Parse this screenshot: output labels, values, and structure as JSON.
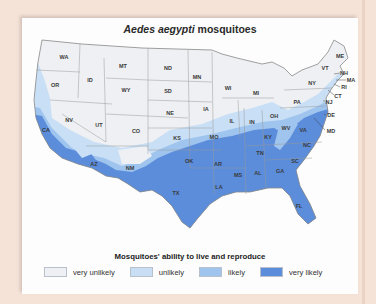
{
  "title": {
    "italic": "Aedes aegypti",
    "rest": " mosquitoes"
  },
  "legend": {
    "title": "Mosquitoes' ability to live and reproduce",
    "items": [
      {
        "label": "very unlikely",
        "color": "#eef0f3"
      },
      {
        "label": "unlikely",
        "color": "#c9dff6"
      },
      {
        "label": "likely",
        "color": "#9fc4ee"
      },
      {
        "label": "very likely",
        "color": "#5b8ddb"
      }
    ]
  },
  "states": [
    {
      "abbr": "WA",
      "x": 42,
      "y": 39
    },
    {
      "abbr": "OR",
      "x": 33,
      "y": 67
    },
    {
      "abbr": "CA",
      "x": 24,
      "y": 112
    },
    {
      "abbr": "ID",
      "x": 68,
      "y": 62
    },
    {
      "abbr": "NV",
      "x": 47,
      "y": 102
    },
    {
      "abbr": "MT",
      "x": 101,
      "y": 48
    },
    {
      "abbr": "WY",
      "x": 104,
      "y": 72
    },
    {
      "abbr": "UT",
      "x": 77,
      "y": 107
    },
    {
      "abbr": "CO",
      "x": 114,
      "y": 113
    },
    {
      "abbr": "AZ",
      "x": 72,
      "y": 146
    },
    {
      "abbr": "NM",
      "x": 108,
      "y": 150
    },
    {
      "abbr": "ND",
      "x": 146,
      "y": 50
    },
    {
      "abbr": "SD",
      "x": 146,
      "y": 73
    },
    {
      "abbr": "NE",
      "x": 148,
      "y": 95
    },
    {
      "abbr": "KS",
      "x": 155,
      "y": 120
    },
    {
      "abbr": "OK",
      "x": 167,
      "y": 143
    },
    {
      "abbr": "TX",
      "x": 154,
      "y": 175
    },
    {
      "abbr": "MN",
      "x": 175,
      "y": 59
    },
    {
      "abbr": "IA",
      "x": 184,
      "y": 91
    },
    {
      "abbr": "MO",
      "x": 192,
      "y": 119
    },
    {
      "abbr": "AR",
      "x": 196,
      "y": 146
    },
    {
      "abbr": "LA",
      "x": 197,
      "y": 169
    },
    {
      "abbr": "WI",
      "x": 206,
      "y": 70
    },
    {
      "abbr": "IL",
      "x": 210,
      "y": 103
    },
    {
      "abbr": "MS",
      "x": 216,
      "y": 157
    },
    {
      "abbr": "MI",
      "x": 234,
      "y": 75
    },
    {
      "abbr": "IN",
      "x": 230,
      "y": 104
    },
    {
      "abbr": "KY",
      "x": 246,
      "y": 119
    },
    {
      "abbr": "TN",
      "x": 238,
      "y": 135
    },
    {
      "abbr": "AL",
      "x": 236,
      "y": 155
    },
    {
      "abbr": "OH",
      "x": 252,
      "y": 98
    },
    {
      "abbr": "GA",
      "x": 258,
      "y": 153
    },
    {
      "abbr": "FL",
      "x": 277,
      "y": 188
    },
    {
      "abbr": "WV",
      "x": 264,
      "y": 110
    },
    {
      "abbr": "VA",
      "x": 281,
      "y": 112
    },
    {
      "abbr": "NC",
      "x": 285,
      "y": 127
    },
    {
      "abbr": "SC",
      "x": 273,
      "y": 143
    },
    {
      "abbr": "PA",
      "x": 275,
      "y": 84
    },
    {
      "abbr": "NY",
      "x": 290,
      "y": 65
    },
    {
      "abbr": "ME",
      "x": 318,
      "y": 38
    },
    {
      "abbr": "VT",
      "x": 303,
      "y": 50
    }
  ],
  "callouts": [
    {
      "abbr": "NH",
      "x": 322,
      "y": 55
    },
    {
      "abbr": "MA",
      "x": 329,
      "y": 62
    },
    {
      "abbr": "RI",
      "x": 322,
      "y": 69
    },
    {
      "abbr": "CT",
      "x": 316,
      "y": 78
    },
    {
      "abbr": "NJ",
      "x": 307,
      "y": 84
    },
    {
      "abbr": "DE",
      "x": 309,
      "y": 97
    },
    {
      "abbr": "MD",
      "x": 309,
      "y": 113
    }
  ]
}
